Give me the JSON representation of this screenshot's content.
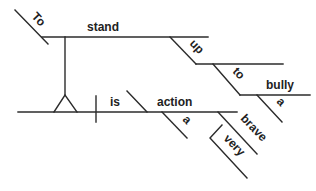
{
  "diagram": {
    "type": "sentence-diagram (Reed-Kellogg)",
    "sentence": "To stand up to a bully is a very brave action",
    "words": {
      "to_infinitive": "To",
      "stand": "stand",
      "up": "up",
      "to_prep": "to",
      "bully": "bully",
      "a_bully": "a",
      "is": "is",
      "action": "action",
      "a_action": "a",
      "brave": "brave",
      "very": "very"
    },
    "colors": {
      "line": "#2b2b2b",
      "text": "#222222",
      "background": "#ffffff"
    }
  }
}
